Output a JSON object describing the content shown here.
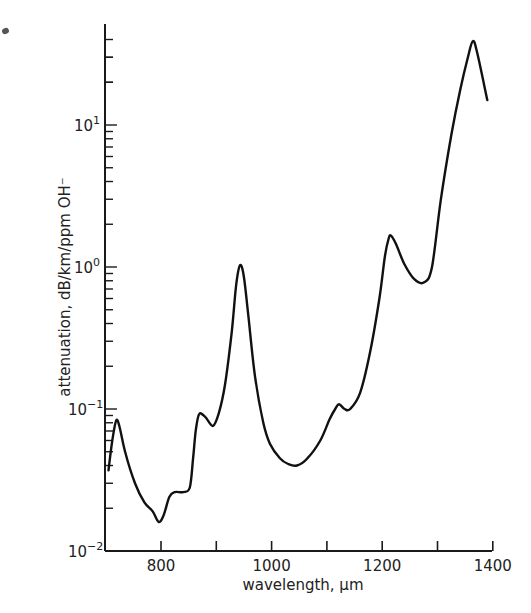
{
  "chart_data": {
    "type": "line",
    "title": "",
    "xlabel": "wavelength, μm",
    "ylabel": "attenuation, dB/km/ppm OH⁻",
    "yscale": "log",
    "xlim": [
      705,
      1400
    ],
    "ylim": [
      0.01,
      50
    ],
    "grid": false,
    "legend": null,
    "x_ticks": [
      800,
      900,
      1000,
      1100,
      1200,
      1300,
      1400
    ],
    "x_tick_labels": [
      "800",
      "1000",
      "1200",
      "1400"
    ],
    "y_tick_labels": [
      {
        "base": "10",
        "exp": "-2",
        "value": 0.01
      },
      {
        "base": "10",
        "exp": "-1",
        "value": 0.1
      },
      {
        "base": "10",
        "exp": "0",
        "value": 1
      },
      {
        "base": "10",
        "exp": "1",
        "value": 10
      }
    ],
    "series": [
      {
        "name": "OH absorption",
        "x": [
          705,
          712,
          719,
          725,
          735,
          753,
          770,
          785,
          796,
          805,
          815,
          825,
          840,
          852,
          858,
          863,
          869,
          880,
          894,
          905,
          916,
          928,
          936,
          943,
          950,
          958,
          970,
          985,
          997,
          1015,
          1030,
          1046,
          1065,
          1088,
          1105,
          1115,
          1122,
          1132,
          1142,
          1160,
          1178,
          1195,
          1205,
          1212,
          1216,
          1225,
          1240,
          1258,
          1276,
          1290,
          1306,
          1325,
          1341,
          1355,
          1364,
          1372,
          1390
        ],
        "values": [
          0.037,
          0.06,
          0.083,
          0.075,
          0.05,
          0.03,
          0.022,
          0.019,
          0.016,
          0.018,
          0.024,
          0.026,
          0.026,
          0.028,
          0.045,
          0.071,
          0.092,
          0.088,
          0.076,
          0.095,
          0.15,
          0.35,
          0.75,
          1.03,
          0.85,
          0.45,
          0.17,
          0.08,
          0.057,
          0.045,
          0.041,
          0.04,
          0.045,
          0.06,
          0.085,
          0.1,
          0.108,
          0.1,
          0.1,
          0.13,
          0.25,
          0.6,
          1.2,
          1.6,
          1.66,
          1.45,
          1.05,
          0.82,
          0.78,
          1.0,
          2.97,
          8.5,
          17.6,
          30,
          39,
          32,
          15
        ]
      }
    ]
  }
}
